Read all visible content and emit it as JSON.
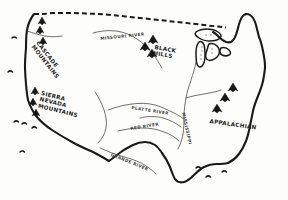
{
  "map": {
    "title": "Hand-drawn sketch map of the continental United States",
    "medium": "black ink pen on white paper",
    "background_color": "#fdfdfc",
    "ink_color": "#1a1a1a",
    "river_ink_color": "#4a4a4a",
    "northern_border_style": "dashed",
    "mountain_ranges": [
      {
        "id": "cascade",
        "label_line1": "CASCADE",
        "label_line2": "MOUNTAINS",
        "x": 40,
        "y": 40,
        "rotation": 52,
        "glyph_count": 3
      },
      {
        "id": "sierra-nevada",
        "label_line1": "SIERRA",
        "label_line2": "NEVADA",
        "label_line3": "MOUNTAINS",
        "x": 42,
        "y": 90,
        "rotation": 14,
        "glyph_count": 3
      },
      {
        "id": "black-hills",
        "label_line1": "BLACK",
        "label_line2": "HILLS",
        "x": 155,
        "y": 44,
        "rotation": 10,
        "glyph_count": 3
      },
      {
        "id": "appalachian",
        "label_line1": "APPALACHIAN",
        "x": 210,
        "y": 118,
        "rotation": 8,
        "glyph_count": 3
      }
    ],
    "rivers": [
      {
        "id": "missouri",
        "label": "MISSOURI RIVER",
        "x": 100,
        "y": 36,
        "rotation": -6
      },
      {
        "id": "platte",
        "label": "PLATTE RIVER",
        "x": 132,
        "y": 105,
        "rotation": 9
      },
      {
        "id": "red",
        "label": "RED RIVER",
        "x": 130,
        "y": 126,
        "rotation": -9
      },
      {
        "id": "mississippi",
        "label": "MISSISSIPPI",
        "x": 186,
        "y": 112,
        "rotation": 78
      },
      {
        "id": "rio-grande",
        "label": "GRANDE RIVER",
        "x": 112,
        "y": 152,
        "rotation": 22
      }
    ],
    "features": [
      {
        "id": "great-lakes",
        "name": "Great Lakes"
      },
      {
        "id": "florida-peninsula",
        "name": "Florida Peninsula"
      },
      {
        "id": "gulf-coast",
        "name": "Gulf Coast"
      },
      {
        "id": "pacific-coast",
        "name": "Pacific Coast"
      },
      {
        "id": "atlantic-coast",
        "name": "Atlantic Coast"
      },
      {
        "id": "canada-border",
        "name": "Northern dashed border"
      }
    ]
  }
}
